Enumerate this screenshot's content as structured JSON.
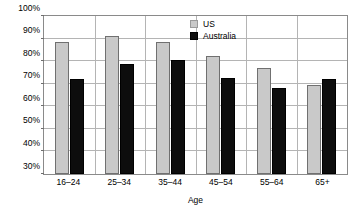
{
  "chart_data": {
    "type": "bar",
    "title": "",
    "xlabel": "Age",
    "ylabel": "",
    "categories": [
      "16–24",
      "25–34",
      "35–44",
      "45–54",
      "55–64",
      "65+"
    ],
    "series": [
      {
        "name": "US",
        "color": "#c9c9c9",
        "values": [
          88.5,
          91.0,
          88.5,
          82.3,
          77.0,
          69.5
        ]
      },
      {
        "name": "Australia",
        "color": "#0d0d0d",
        "values": [
          72.3,
          78.6,
          80.3,
          72.7,
          68.2,
          72.1
        ]
      }
    ],
    "ylim": [
      30,
      100
    ],
    "ytick_values": [
      30,
      40,
      50,
      60,
      70,
      80,
      90,
      100
    ],
    "ytick_labels": [
      "30%",
      "40%",
      "50%",
      "60%",
      "70%",
      "80%",
      "90%",
      "100%"
    ],
    "grid": true,
    "legend_position": "top-center-right",
    "value_suffix": "%"
  }
}
